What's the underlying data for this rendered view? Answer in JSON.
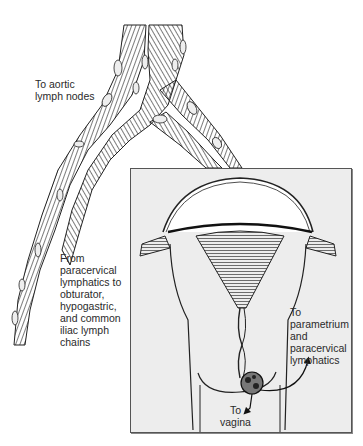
{
  "figure": {
    "type": "anatomical-diagram",
    "colors": {
      "background": "#ffffff",
      "inset_background": "#ededed",
      "line": "#1a1a1a",
      "inset_border": "#555555"
    }
  },
  "labels": {
    "aortic": {
      "lines": [
        "To aortic",
        "lymph nodes"
      ]
    },
    "pelvic": {
      "lines": [
        "From",
        "paracervical",
        "lymphatics to",
        "obturator,",
        "hypogastric,",
        "and common",
        "iliac lymph",
        "chains"
      ]
    },
    "parametrium": {
      "lines": [
        "To",
        "parametrium",
        "and",
        "paracervical",
        "lymphatics"
      ]
    },
    "vagina": {
      "lines": [
        "To",
        "vagina"
      ]
    }
  },
  "structures": {
    "upper": "lymphatic vessels with nodes (aortic and iliac chains)",
    "inset": "uterus and cervix with tumor and spread arrows"
  }
}
